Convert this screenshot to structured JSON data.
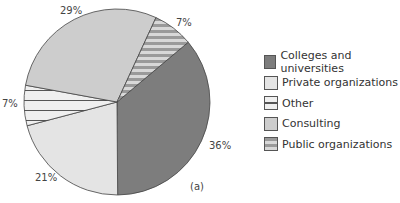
{
  "chart_data": {
    "type": "pie",
    "title": "",
    "caption": "(a)",
    "categories": [
      "Colleges and universities",
      "Private organizations",
      "Other",
      "Consulting",
      "Public organizations"
    ],
    "values": [
      36,
      21,
      7,
      29,
      7
    ],
    "labels": [
      "36%",
      "21%",
      "7%",
      "29%",
      "7%"
    ],
    "colors": [
      "#7d7d7d",
      "#e4e4e4",
      "#efefef",
      "#cdcdcd",
      "#bdbdbd"
    ],
    "patterns": [
      "solid",
      "solid",
      "horizontal-lines-thin",
      "solid",
      "horizontal-stripes"
    ],
    "start_angle_deg": 50,
    "direction": "clockwise",
    "legend_position": "right"
  },
  "labels": {
    "colleges": "36%",
    "private": "21%",
    "other": "7%",
    "consulting": "29%",
    "public": "7%"
  },
  "legend": {
    "items": [
      {
        "label": "Colleges and universities"
      },
      {
        "label": "Private organizations"
      },
      {
        "label": "Other"
      },
      {
        "label": "Consulting"
      },
      {
        "label": "Public organizations"
      }
    ]
  },
  "caption": "(a)"
}
